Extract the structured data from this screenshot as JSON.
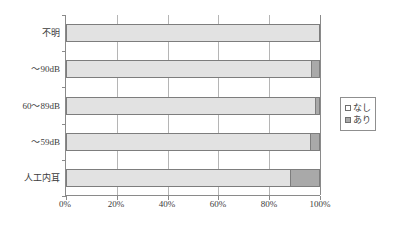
{
  "chart_data": {
    "type": "bar",
    "orientation": "horizontal",
    "stacked": true,
    "normalized": true,
    "title": "",
    "subtitle": "",
    "xlabel": "",
    "ylabel": "",
    "categories": [
      "不明",
      "～90dB",
      "60～89dB",
      "～59dB",
      "人工内耳"
    ],
    "series": [
      {
        "name": "なし",
        "color": "#e2e2e2",
        "values": [
          100,
          96.5,
          98,
          96,
          88
        ]
      },
      {
        "name": "あり",
        "color": "#a9a9a9",
        "values": [
          0,
          3.5,
          2,
          4,
          12
        ]
      }
    ],
    "xlim": [
      0,
      100
    ],
    "xticks": [
      0,
      20,
      40,
      60,
      80,
      100
    ],
    "xtick_labels": [
      "0%",
      "20%",
      "40%",
      "60%",
      "80%",
      "100%"
    ],
    "grid": "vertical",
    "legend_position": "right"
  },
  "legend": {
    "items": [
      {
        "label": "なし",
        "swatch": "legend-swatch-nashi"
      },
      {
        "label": "あり",
        "swatch": "legend-swatch-ari"
      }
    ]
  },
  "colors": {
    "nashi": "#e2e2e2",
    "ari": "#a9a9a9",
    "axis": "#8a8a8a",
    "grid": "#b5b5b5",
    "bar_border": "#7d7d7d",
    "text": "#3c3c3c",
    "background": "#ffffff"
  }
}
